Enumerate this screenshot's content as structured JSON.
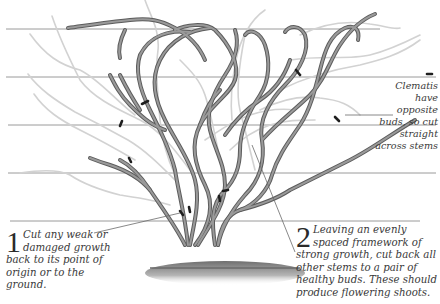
{
  "diagram": {
    "colors": {
      "wire": "#9a9a9a",
      "stem_kept": "#7a7a7a",
      "stem_kept_edge": "#5a5a5a",
      "stem_removed": "#cfcfcf",
      "cut_mark": "#222222",
      "ground": "#8a8a8a",
      "text": "#3a3a3a"
    },
    "wires_y": [
      29,
      76,
      124,
      172,
      220
    ]
  },
  "annotations": {
    "clematis_note": "Clematis have opposite buds, so cut straight across stems",
    "step1": {
      "number": "1",
      "text": "Cut any weak or damaged growth back to its point of origin or to the ground."
    },
    "step2": {
      "number": "2",
      "text": "Leaving an evenly spaced framework of strong growth, cut back all other stems to a pair of healthy buds. These should produce flowering shoots."
    }
  }
}
